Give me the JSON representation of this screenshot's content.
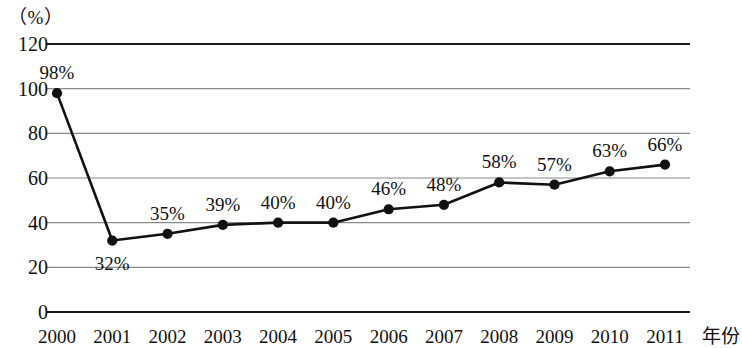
{
  "chart_data": {
    "type": "line",
    "title": "",
    "subtitle": "",
    "xlabel": "年份",
    "ylabel": "（%）",
    "unit_label": "（%）",
    "categories": [
      "2000",
      "2001",
      "2002",
      "2003",
      "2004",
      "2005",
      "2006",
      "2007",
      "2008",
      "2009",
      "2010",
      "2011"
    ],
    "values": [
      98,
      32,
      35,
      39,
      40,
      40,
      46,
      48,
      58,
      57,
      63,
      66
    ],
    "point_labels": [
      "98%",
      "32%",
      "35%",
      "39%",
      "40%",
      "40%",
      "46%",
      "48%",
      "58%",
      "57%",
      "63%",
      "66%"
    ],
    "label_positions": [
      "above",
      "below",
      "above",
      "above",
      "above",
      "above",
      "above",
      "above",
      "above",
      "above",
      "above",
      "above"
    ],
    "ylim": [
      0,
      120
    ],
    "yticks": [
      0,
      20,
      40,
      60,
      80,
      100,
      120
    ],
    "ytick_labels": [
      "0",
      "20",
      "40",
      "60",
      "80",
      "100",
      "120"
    ],
    "grid": true,
    "legend": "none",
    "series": [
      {
        "name": "",
        "values": [
          98,
          32,
          35,
          39,
          40,
          40,
          46,
          48,
          58,
          57,
          63,
          66
        ]
      }
    ],
    "colors": {
      "line": "#111111",
      "marker": "#111111",
      "grid": "#8a8a8a",
      "axis": "#1a1a1a",
      "background": "#ffffff",
      "text": "#111111"
    }
  }
}
